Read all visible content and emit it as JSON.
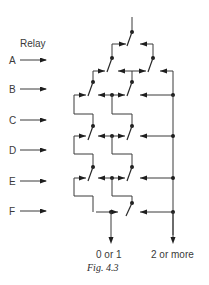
{
  "figure": {
    "caption": "Fig. 4.3",
    "relay_heading": "Relay",
    "relays": [
      {
        "label": "A",
        "y": 60
      },
      {
        "label": "B",
        "y": 89
      },
      {
        "label": "C",
        "y": 120
      },
      {
        "label": "D",
        "y": 150
      },
      {
        "label": "E",
        "y": 181
      },
      {
        "label": "F",
        "y": 211
      }
    ],
    "outputs": [
      {
        "label": "0 or 1"
      },
      {
        "label": "2 or more"
      }
    ],
    "colors": {
      "ink": "#2a2a2a",
      "background": "#ffffff"
    }
  }
}
